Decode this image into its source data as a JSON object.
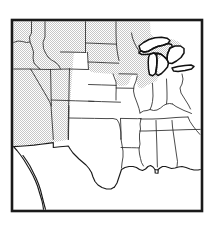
{
  "figure": {
    "kind": "map",
    "title": "",
    "caption": "",
    "projection_note": "",
    "border": {
      "visible": true,
      "color": "#1a1a1a",
      "thickness_px": 2.6,
      "x": 12,
      "y": 20,
      "width": 190,
      "height": 191
    }
  },
  "legend": {
    "visible": false,
    "entries": [
      {
        "label": "",
        "pattern": "stipple",
        "color": "#8c8c8c"
      },
      {
        "label": "",
        "pattern": "none",
        "color": "#ffffff"
      }
    ]
  },
  "colors": {
    "background": "#ffffff",
    "frame": "#1a1a1a",
    "state_border": "#2b2b2b",
    "coastline": "#1a1a1a",
    "lake_outline": "#111111",
    "shade_dot": "#8c8c8c",
    "shade_fill": "#ffffff"
  },
  "shading": {
    "pattern": "stipple-dots",
    "description": "fine gray dot screen",
    "dot_spacing_px": 2,
    "dot_radius_px": 0.42,
    "coverage": "western and northern states"
  },
  "regions": {
    "shaded": [
      "Washington",
      "Oregon",
      "Idaho",
      "Montana",
      "Wyoming",
      "North Dakota",
      "South Dakota",
      "Minnesota",
      "Wisconsin",
      "Michigan",
      "Nevada",
      "Utah",
      "Colorado",
      "California",
      "Arizona",
      "New Mexico"
    ],
    "unshaded": [
      "Nebraska",
      "Kansas",
      "Iowa",
      "Missouri",
      "Oklahoma",
      "Texas",
      "Arkansas",
      "Louisiana",
      "Illinois",
      "Indiana",
      "Ohio",
      "Kentucky",
      "Tennessee",
      "Mississippi",
      "Alabama",
      "Georgia",
      "Florida",
      "West Virginia",
      "Virginia",
      "North Carolina",
      "South Carolina"
    ]
  },
  "features": {
    "great_lakes": [
      "Lake Superior",
      "Lake Michigan",
      "Lake Huron",
      "Lake Erie"
    ],
    "coastlines": [
      "Pacific Coast",
      "Gulf of Mexico",
      "Atlantic Coast"
    ],
    "borders_shown": [
      "state boundaries",
      "national boundary"
    ]
  },
  "annotations": [],
  "axes": {
    "visible": false,
    "x_ticks": [],
    "y_ticks": []
  },
  "scale_bar": {
    "visible": false,
    "label": ""
  },
  "north_arrow": {
    "visible": false,
    "label": ""
  }
}
